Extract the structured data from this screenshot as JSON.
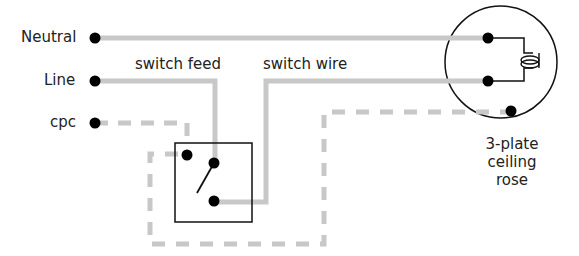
{
  "labels": {
    "neutral": "Neutral",
    "line": "Line",
    "cpc": "cpc",
    "switch_feed": "switch feed",
    "switch_wire": "switch wire",
    "rose_line1": "3-plate",
    "rose_line2": "ceiling",
    "rose_line3": "rose"
  },
  "colors": {
    "wire": "#c8c8c8",
    "terminal": "#000000",
    "outline": "#111111",
    "text": "#222222"
  }
}
